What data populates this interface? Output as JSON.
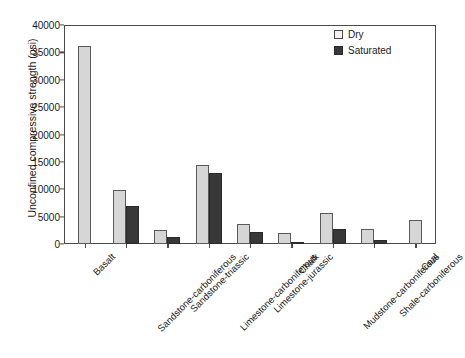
{
  "chart_data": {
    "type": "bar",
    "title": "",
    "xlabel": "",
    "ylabel": "Unconfined compressive strength (psi)",
    "ylim": [
      0,
      40000
    ],
    "ytick_labels": [
      "40000",
      "35000",
      "30000",
      "25000",
      "20000",
      "15000",
      "10000",
      "5000",
      "0"
    ],
    "ytick_values": [
      40000,
      35000,
      30000,
      25000,
      20000,
      15000,
      10000,
      5000,
      0
    ],
    "grid": false,
    "legend_position": "top-right",
    "categories": [
      "Basalt",
      "Sandstone-carboniferous",
      "Sandstone-triassic",
      "Limestone-carboniferous",
      "Limestone-jurassic",
      "Chalk",
      "Mudstone-carboniferous",
      "Shale-carboniferous",
      "Coal"
    ],
    "series": [
      {
        "name": "Dry",
        "color": "#d6d6d6",
        "values": [
          36200,
          9900,
          2500,
          14400,
          3600,
          2000,
          5700,
          2700,
          4400
        ]
      },
      {
        "name": "Saturated",
        "color": "#383838",
        "values": [
          null,
          6900,
          1300,
          12900,
          2200,
          400,
          2700,
          700,
          null
        ]
      }
    ]
  },
  "legend": {
    "items": [
      {
        "label": "Dry",
        "swatch": "dry"
      },
      {
        "label": "Saturated",
        "swatch": "sat"
      }
    ]
  }
}
